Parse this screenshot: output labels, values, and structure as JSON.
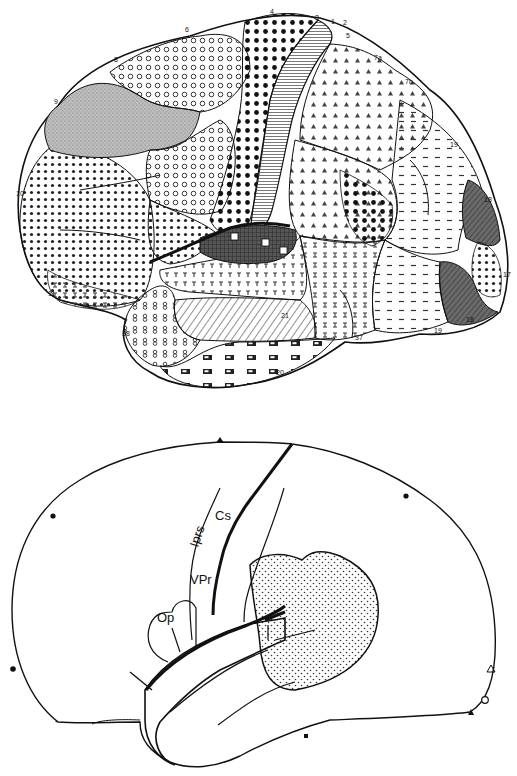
{
  "top_figure": {
    "description": "Lateral view of the brain with cytoarchitectonic area patterns",
    "area_labels": [
      {
        "id": "a1",
        "text": "1",
        "x": 331,
        "y": 24
      },
      {
        "id": "a2",
        "text": "2",
        "x": 343,
        "y": 25
      },
      {
        "id": "a3",
        "text": "3",
        "x": 317,
        "y": 22
      },
      {
        "id": "a4",
        "text": "4",
        "x": 272,
        "y": 16
      },
      {
        "id": "a5",
        "text": "5",
        "x": 346,
        "y": 37
      },
      {
        "id": "a6",
        "text": "6",
        "x": 187,
        "y": 30
      },
      {
        "id": "a7a",
        "text": "7a",
        "x": 378,
        "y": 60
      },
      {
        "id": "a7b",
        "text": "7b",
        "x": 408,
        "y": 83
      },
      {
        "id": "a8",
        "text": "8",
        "x": 117,
        "y": 59
      },
      {
        "id": "a9",
        "text": "9",
        "x": 57,
        "y": 101
      },
      {
        "id": "a10",
        "text": "10",
        "x": 20,
        "y": 186
      },
      {
        "id": "a11",
        "text": "11",
        "x": 52,
        "y": 296
      },
      {
        "id": "a17",
        "text": "17",
        "x": 507,
        "y": 275
      },
      {
        "id": "a18",
        "text": "18",
        "x": 470,
        "y": 320
      },
      {
        "id": "a18b",
        "text": "18",
        "x": 488,
        "y": 200
      },
      {
        "id": "a19",
        "text": "19",
        "x": 454,
        "y": 147
      },
      {
        "id": "a19b",
        "text": "19",
        "x": 438,
        "y": 330
      },
      {
        "id": "a20",
        "text": "20",
        "x": 280,
        "y": 372
      },
      {
        "id": "a21",
        "text": "21",
        "x": 285,
        "y": 316
      },
      {
        "id": "a37",
        "text": "37",
        "x": 360,
        "y": 338
      },
      {
        "id": "a38",
        "text": "38",
        "x": 126,
        "y": 334
      }
    ]
  },
  "bottom_figure": {
    "description": "Schematic lateral hemisphere with sulci and stippled region",
    "labels": {
      "cs": "Cs",
      "iprs": "Iprs",
      "vpr": "VPr",
      "op": "Op"
    }
  },
  "colors": {
    "ink": "#111111",
    "background": "#ffffff",
    "gray_fill": "#b8b8b8",
    "dark_fill": "#3a3a3a"
  }
}
